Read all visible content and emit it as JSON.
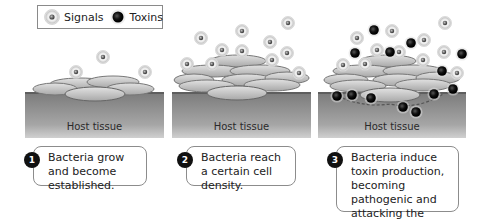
{
  "legend": {
    "items": [
      {
        "label": "Signals",
        "icon": "signal-molecule-icon"
      },
      {
        "label": "Toxins",
        "icon": "toxin-molecule-icon"
      }
    ]
  },
  "panels": [
    {
      "step": "1",
      "tissue_label": "Host tissue",
      "caption": "Bacteria grow and become established."
    },
    {
      "step": "2",
      "tissue_label": "Host tissue",
      "caption": "Bacteria reach a certain cell density."
    },
    {
      "step": "3",
      "tissue_label": "Host tissue",
      "caption": "Bacteria induce toxin production, becoming pathogenic and attacking the host."
    }
  ],
  "colors": {
    "tissue_top": "#7d7d7d",
    "bacteria": "#bdbdbd",
    "signal_ring": "#d8d8d8",
    "toxin": "#1a1a1a"
  }
}
